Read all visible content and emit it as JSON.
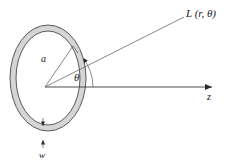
{
  "figure": {
    "background_color": "#ffffff",
    "width": 240,
    "height": 162
  },
  "labels": {
    "observation_point": "L (r, θ)",
    "radius": "a",
    "angle": "θ",
    "axis": "z",
    "width": "w"
  },
  "colors": {
    "band_fill": "#d5d5d5",
    "band_stroke": "#4a4a4a",
    "line": "#555555",
    "axis": "#3a3a3a",
    "text": "#1a1a1a"
  },
  "geometry": {
    "center": {
      "x": 45,
      "y": 87
    },
    "ring_center": {
      "x": 48,
      "y": 78
    },
    "outer_rx": 38,
    "outer_ry": 53,
    "inner_rx": 32,
    "inner_ry": 47,
    "axis_end": {
      "x": 218,
      "y": 87
    },
    "ray_end": {
      "x": 186,
      "y": 17
    },
    "radius_end": {
      "x": 73,
      "y": 47
    },
    "angle_arc_radius": 48
  }
}
